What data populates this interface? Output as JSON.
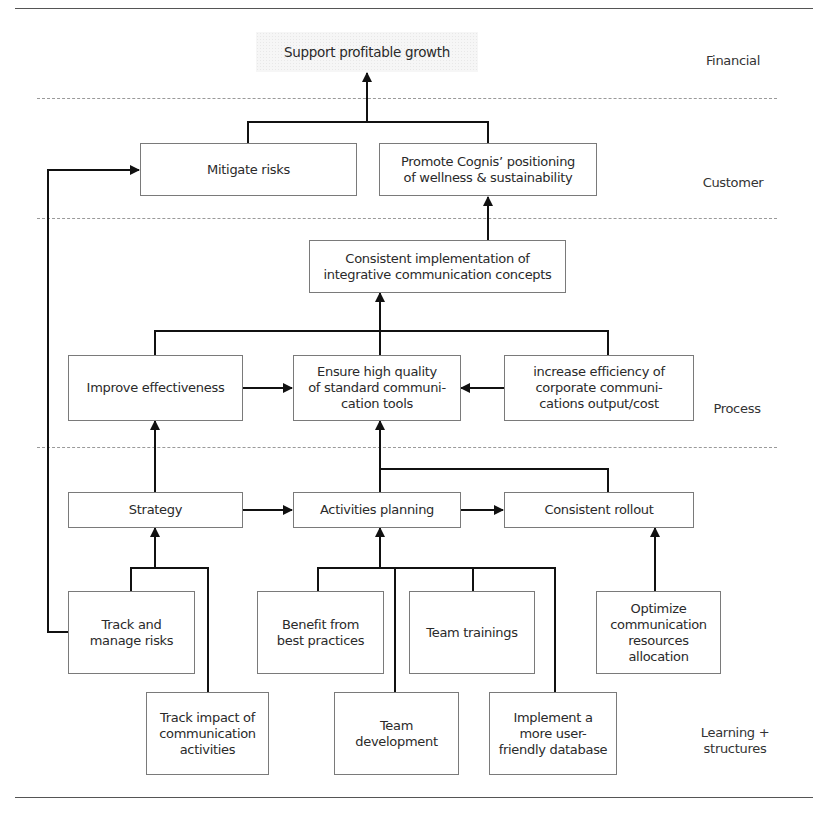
{
  "lanes": {
    "financial": "Financial",
    "customer": "Customer",
    "process": "Process",
    "learning": "Learning +\nstructures"
  },
  "financial": {
    "goal": "Support profitable growth"
  },
  "customer": {
    "mitigate_risks": "Mitigate risks",
    "promote_positioning": "Promote Cognis’ positioning\nof wellness & sustainability"
  },
  "process": {
    "consistent_implementation": "Consistent implementation of\nintegrative communication concepts",
    "improve_effectiveness": "Improve effectiveness",
    "ensure_quality": "Ensure high quality\nof standard communi-\ncation tools",
    "increase_efficiency": "increase efficiency of\ncorporate communi-\ncations output/cost",
    "strategy": "Strategy",
    "activities_planning": "Activities planning",
    "consistent_rollout": "Consistent rollout"
  },
  "learning": {
    "track_manage_risks": "Track and\nmanage risks",
    "track_impact": "Track impact of\ncommunication\nactivities",
    "benefit_best_practices": "Benefit from\nbest practices",
    "team_development": "Team\ndevelopment",
    "team_trainings": "Team trainings",
    "implement_database": "Implement a\nmore user-\nfriendly database",
    "optimize_resources": "Optimize\ncommunication\nresources\nallocation"
  },
  "colors": {
    "line": "#111111",
    "box_border": "#7a7a7a",
    "dash": "#9a9a9a",
    "text": "#2a2a2a"
  }
}
